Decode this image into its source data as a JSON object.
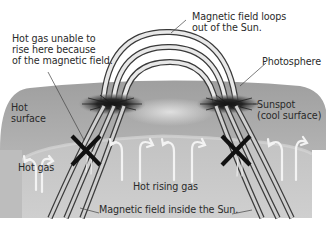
{
  "diagram": {
    "labels": {
      "loops": [
        "Magnetic field loops",
        "out of the Sun."
      ],
      "hot_gas_unable": [
        "Hot gas unable to",
        "rise here because",
        "of the magnetic field."
      ],
      "photosphere": "Photosphere",
      "hot_surface": [
        "Hot",
        "surface"
      ],
      "sunspot": [
        "Sunspot",
        "(cool surface)"
      ],
      "hot_gas": "Hot gas",
      "hot_rising_gas": "Hot rising gas",
      "field_inside": "Magnetic field inside the Sun."
    },
    "symbols": {
      "blocked_marker": "X",
      "blocked_count": 2,
      "rising_gas_arrow_count": 8
    },
    "colors": {
      "background": "#ffffff",
      "photosphere": "#a9a9a9",
      "interior": "#c9c9c9",
      "sunspot": "#1e1e1e",
      "field_line": "#3a3a3a",
      "arrow": "#f2f2f2",
      "marker": "#111111",
      "text": "#2a2a2a"
    }
  }
}
